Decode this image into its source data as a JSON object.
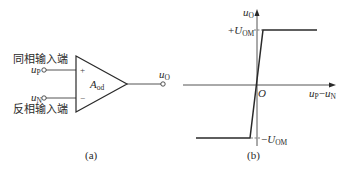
{
  "figure_a": {
    "label_noninverting": "同相输入端",
    "label_inverting": "反相输入端",
    "input_p": {
      "var": "u",
      "sub": "P"
    },
    "input_n": {
      "var": "u",
      "sub": "N"
    },
    "output": {
      "var": "u",
      "sub": "O"
    },
    "gain": {
      "var": "A",
      "sub": "od"
    },
    "plus_sign": "+",
    "minus_sign": "−",
    "caption": "(a)"
  },
  "figure_b": {
    "y_axis": {
      "var": "u",
      "sub": "O"
    },
    "x_axis": {
      "var1": "u",
      "sub1": "P",
      "dash": "−",
      "var2": "u",
      "sub2": "N"
    },
    "origin": "O",
    "pos_sat": {
      "prefix": "+",
      "var": "U",
      "sub": "OM"
    },
    "neg_sat": {
      "prefix": "−",
      "var": "U",
      "sub": "OM"
    },
    "caption": "(b)"
  },
  "colors": {
    "line": "#2a2a2a",
    "bg": "#ffffff"
  }
}
